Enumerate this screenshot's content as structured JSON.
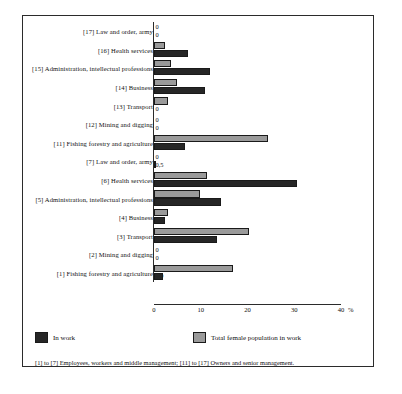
{
  "chart_data": {
    "type": "bar",
    "orientation": "horizontal",
    "title": "",
    "subtitle": "",
    "xlabel": "%",
    "ylabel": "",
    "xlim": [
      0,
      40
    ],
    "xticks": [
      0,
      10,
      20,
      30,
      40
    ],
    "xtick_labels": [
      "0",
      "10",
      "20",
      "30",
      "40"
    ],
    "axis_unit": "%",
    "grid": false,
    "legend_position": "bottom-left",
    "categories": [
      "[17] Law and order, army",
      "[16] Health services",
      "[15] Administration, intellectual professions",
      "[14] Business",
      "[13] Transport",
      "[12] Mining and digging",
      "[11] Fishing forestry and agriculture",
      "[7] Law and order, army",
      "[6] Health services",
      "[5] Administration, intellectual professions",
      "[4] Business",
      "[3] Transport",
      "[2] Mining and digging",
      "[1] Fishing forestry and agriculture"
    ],
    "series": [
      {
        "name": "Total female population in work",
        "color": "#9a9a9a",
        "values": [
          0,
          2.3,
          3.6,
          4.9,
          3,
          0,
          24.3,
          0,
          11.4,
          9.9,
          3,
          20.4,
          0,
          17
        ]
      },
      {
        "name": "In work",
        "color": "#262626",
        "values": [
          0,
          7.2,
          12,
          11,
          0,
          0,
          6.7,
          0.5,
          30.6,
          14.4,
          2.4,
          13.4,
          0,
          1.9
        ]
      }
    ],
    "value_labels": [
      {
        "top": "0",
        "bottom": "0"
      },
      {
        "top": "2,3",
        "bottom": "7,2"
      },
      {
        "top": "3,6",
        "bottom": "12"
      },
      {
        "top": "4,9",
        "bottom": "11"
      },
      {
        "top": "3",
        "bottom": "0"
      },
      {
        "top": "0",
        "bottom": "0"
      },
      {
        "top": "24,3",
        "bottom": "6,7"
      },
      {
        "top": "0",
        "bottom": "0,5"
      },
      {
        "top": "11,4",
        "bottom": "30,6"
      },
      {
        "top": "9,9",
        "bottom": "14,4"
      },
      {
        "top": "3",
        "bottom": "2,4"
      },
      {
        "top": "20,4",
        "bottom": "13,4"
      },
      {
        "top": "0",
        "bottom": "0"
      },
      {
        "top": "17",
        "bottom": "1,9"
      }
    ]
  },
  "legend": {
    "in_work_label": "In work",
    "total_female_label": "Total female population in work"
  },
  "footnote": {
    "text": "[1] to [7] Employees, workers and middle management; [11] to [17] Owners and senior management."
  }
}
